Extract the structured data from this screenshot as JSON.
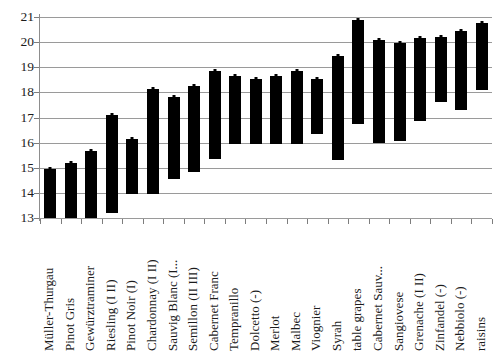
{
  "chart_data": {
    "type": "bar",
    "bar_style": "floating-range",
    "title": "",
    "subtitle": "",
    "xlabel": "",
    "ylabel": "",
    "ylim": [
      13,
      21
    ],
    "ytick_step": 1,
    "yticks": [
      "21",
      "20",
      "19",
      "18",
      "17",
      "16",
      "15",
      "14",
      "13"
    ],
    "grid": true,
    "legend": "none",
    "bar_color": "#000000",
    "categories": [
      "Müller-Thurgau",
      "Pinot Gris",
      "Gewürztraminer",
      "Riesling (I II)",
      "Pinot Noir (I)",
      "Chardonnay (I II)",
      "Sauvig  Blanc (I...",
      "Semillon (II III)",
      "Cabernet Franc",
      "Tempranillo",
      "Dolcetto (-)",
      "Merlot",
      "Malbec",
      "Viognier",
      "Syrah",
      "table grapes",
      "Cabernet Sauv...",
      "Sangiovese",
      "Grenache (I II)",
      "Zinfandel (-)",
      "Nebbiolo (-)",
      "raisins"
    ],
    "series": [
      {
        "name": "low",
        "values": [
          13.0,
          13.0,
          13.0,
          13.2,
          13.95,
          13.95,
          14.55,
          14.85,
          15.35,
          15.95,
          15.95,
          15.95,
          15.95,
          16.35,
          15.3,
          16.75,
          16.0,
          16.05,
          16.85,
          17.6,
          17.3,
          18.1
        ]
      },
      {
        "name": "high",
        "values": [
          14.95,
          15.2,
          15.65,
          17.1,
          16.15,
          18.15,
          17.8,
          18.25,
          18.85,
          18.65,
          18.55,
          18.65,
          18.85,
          18.55,
          19.45,
          20.9,
          20.1,
          19.95,
          20.15,
          20.2,
          20.45,
          20.75
        ]
      }
    ]
  }
}
